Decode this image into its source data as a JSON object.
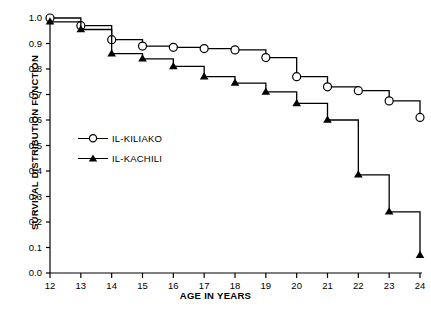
{
  "chart_data": {
    "type": "line",
    "title": "",
    "xlabel": "AGE IN YEARS",
    "ylabel": "SURVIVAL DISTRIBUTION FUNCTION",
    "x": [
      12,
      13,
      14,
      15,
      16,
      17,
      18,
      19,
      20,
      21,
      22,
      23,
      24
    ],
    "xlim": [
      12,
      24
    ],
    "ylim": [
      0.0,
      1.0
    ],
    "xticks": [
      "12",
      "13",
      "14",
      "15",
      "16",
      "17",
      "18",
      "19",
      "20",
      "21",
      "22",
      "23",
      "24"
    ],
    "yticks": [
      "0.0",
      "0.1",
      "0.2",
      "0.3",
      "0.4",
      "0.5",
      "0.6",
      "0.7",
      "0.8",
      "0.9",
      "1.0"
    ],
    "grid": false,
    "legend_position": "center-left",
    "step_style": "post",
    "series": [
      {
        "name": "IL-KILIAKO",
        "marker": "open-circle",
        "color": "#000000",
        "values": [
          1.0,
          0.97,
          0.915,
          0.89,
          0.885,
          0.88,
          0.875,
          0.845,
          0.77,
          0.73,
          0.715,
          0.675,
          0.61
        ]
      },
      {
        "name": "IL-KACHILI",
        "marker": "filled-triangle",
        "color": "#000000",
        "values": [
          0.985,
          0.955,
          0.86,
          0.84,
          0.81,
          0.77,
          0.745,
          0.71,
          0.665,
          0.6,
          0.385,
          0.24,
          0.07
        ]
      }
    ]
  },
  "legend": {
    "items": [
      {
        "label": "IL-KILIAKO",
        "marker": "open-circle"
      },
      {
        "label": "IL-KACHILI",
        "marker": "filled-triangle"
      }
    ]
  },
  "axes": {
    "x_title": "AGE IN YEARS",
    "y_title": "SURVIVAL DISTRIBUTION FUNCTION"
  }
}
